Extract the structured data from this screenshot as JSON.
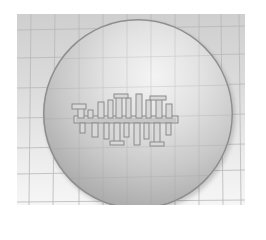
{
  "scene": {
    "description": "Grayscale 3D render of a translucent sphere over a perspective grid floor with a small mechanical structure inside",
    "colors": {
      "background": "#ffffff",
      "floor_top": "#cfcfcf",
      "floor_bottom": "#f6f6f6",
      "grid_line": "#b8b8b8",
      "sphere_highlight": "#f4f4f4",
      "sphere_edge": "#7a7a7a",
      "structure_fill": "#d8d8d8",
      "structure_stroke": "#8a8a8a"
    }
  }
}
